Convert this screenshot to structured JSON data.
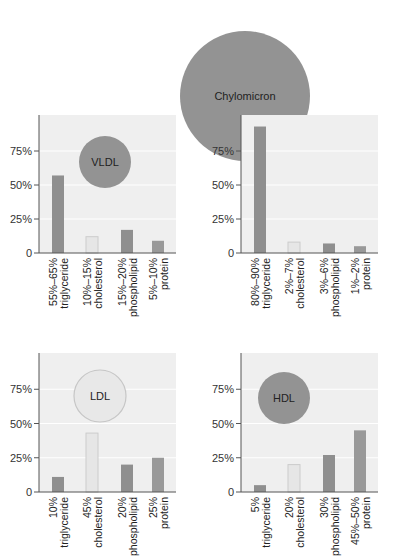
{
  "figure": {
    "colors": {
      "panel_bg": "#efefef",
      "gridline": "#ffffff",
      "axis": "#555555",
      "bar_dark": "#8f8f8f",
      "bar_mid": "#999999",
      "bar_light": "#e6e6e6",
      "bar_light_border": "#cccccc",
      "particle_dark": "#939393",
      "particle_light": "#e8e8e8",
      "particle_light_border": "#c6c6c6",
      "text": "#222222"
    }
  },
  "chart_data": [
    {
      "type": "bar",
      "title": "VLDL",
      "particle": "VLDL",
      "particle_style": "dark",
      "ylim": [
        0,
        100
      ],
      "yticks": [
        "0",
        "25%",
        "50%",
        "75%"
      ],
      "categories": [
        "triglyceride",
        "cholesterol",
        "phospholipid",
        "protein"
      ],
      "value_labels": [
        "55%–65%",
        "10%–15%",
        "15%–20%",
        "5%–10%"
      ],
      "values": [
        57,
        12,
        17,
        9
      ],
      "bar_styles": [
        "dark",
        "light",
        "dark",
        "mid"
      ]
    },
    {
      "type": "bar",
      "title": "Chylomicron",
      "particle": "Chylomicron",
      "particle_style": "dark",
      "ylim": [
        0,
        100
      ],
      "yticks": [
        "0",
        "25%",
        "50%",
        "75%"
      ],
      "categories": [
        "triglyceride",
        "cholesterol",
        "phospholipid",
        "protein"
      ],
      "value_labels": [
        "80%–90%",
        "2%–7%",
        "3%–6%",
        "1%–2%"
      ],
      "values": [
        93,
        8,
        7,
        5
      ],
      "bar_styles": [
        "dark",
        "light",
        "dark",
        "mid"
      ]
    },
    {
      "type": "bar",
      "title": "LDL",
      "particle": "LDL",
      "particle_style": "light",
      "ylim": [
        0,
        100
      ],
      "yticks": [
        "0",
        "25%",
        "50%",
        "75%"
      ],
      "categories": [
        "triglyceride",
        "cholesterol",
        "phospholipid",
        "protein"
      ],
      "value_labels": [
        "10%",
        "45%",
        "20%",
        "25%"
      ],
      "values": [
        11,
        43,
        20,
        25
      ],
      "bar_styles": [
        "dark",
        "light",
        "dark",
        "mid"
      ]
    },
    {
      "type": "bar",
      "title": "HDL",
      "particle": "HDL",
      "particle_style": "dark",
      "ylim": [
        0,
        100
      ],
      "yticks": [
        "0",
        "25%",
        "50%",
        "75%"
      ],
      "categories": [
        "triglyceride",
        "cholesterol",
        "phospholipid",
        "protein"
      ],
      "value_labels": [
        "5%",
        "20%",
        "30%",
        "45%–50%"
      ],
      "values": [
        5,
        20,
        27,
        45
      ],
      "bar_styles": [
        "dark",
        "light",
        "dark",
        "mid"
      ]
    }
  ]
}
